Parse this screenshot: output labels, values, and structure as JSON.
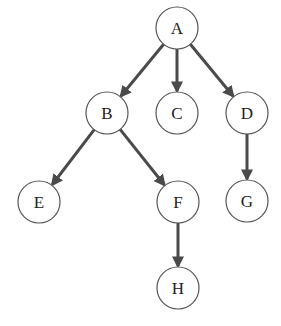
{
  "diagram": {
    "type": "tree",
    "colors": {
      "edge": "#4a4a4a",
      "node_stroke": "#555555",
      "node_fill": "#ffffff",
      "label": "#222222"
    },
    "nodes": [
      {
        "id": "A",
        "label": "A",
        "x": 177,
        "y": 28
      },
      {
        "id": "B",
        "label": "B",
        "x": 107,
        "y": 113
      },
      {
        "id": "C",
        "label": "C",
        "x": 177,
        "y": 113
      },
      {
        "id": "D",
        "label": "D",
        "x": 247,
        "y": 113
      },
      {
        "id": "E",
        "label": "E",
        "x": 39,
        "y": 202
      },
      {
        "id": "F",
        "label": "F",
        "x": 178,
        "y": 202
      },
      {
        "id": "G",
        "label": "G",
        "x": 247,
        "y": 201
      },
      {
        "id": "H",
        "label": "H",
        "x": 178,
        "y": 288
      }
    ],
    "edges": [
      {
        "from": "A",
        "to": "B"
      },
      {
        "from": "A",
        "to": "C"
      },
      {
        "from": "A",
        "to": "D"
      },
      {
        "from": "B",
        "to": "E"
      },
      {
        "from": "B",
        "to": "F"
      },
      {
        "from": "D",
        "to": "G"
      },
      {
        "from": "F",
        "to": "H"
      }
    ]
  }
}
